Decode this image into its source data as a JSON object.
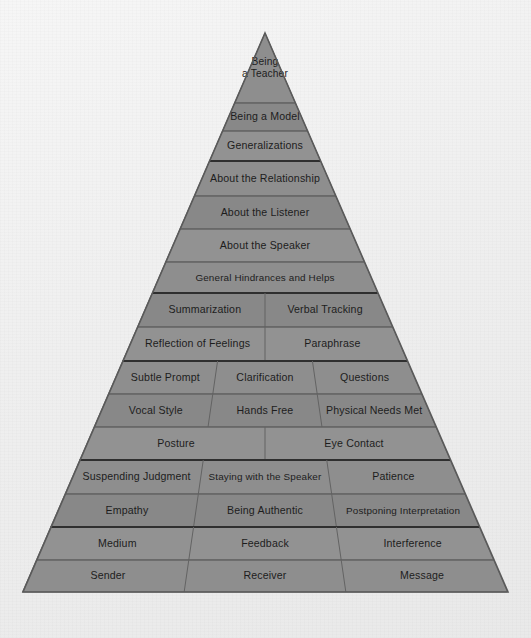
{
  "figure": {
    "name": "communication-pyramid",
    "shape": "triangle",
    "apex": {
      "x": 265,
      "y": 33
    },
    "base": {
      "left_x": 23,
      "right_x": 508,
      "y": 592
    },
    "colors": {
      "background": "#f1f1f1",
      "band_fill": "#8b8b8b",
      "band_border": "#5e5e5e",
      "outline": "#5a5a5a",
      "label_text": "#1d1d1d"
    }
  },
  "rows": [
    {
      "index": 0,
      "top": 33,
      "bottom": 103,
      "group_divider": false,
      "cells": [
        {
          "label": "Being\na Teacher",
          "lines": [
            "Being",
            "a Teacher"
          ]
        }
      ]
    },
    {
      "index": 1,
      "top": 103,
      "bottom": 131,
      "group_divider": false,
      "cells": [
        {
          "label": "Being a Model",
          "lines": [
            "Being a Model"
          ]
        }
      ]
    },
    {
      "index": 2,
      "top": 131,
      "bottom": 161,
      "group_divider": false,
      "cells": [
        {
          "label": "Generalizations",
          "lines": [
            "Generalizations"
          ]
        }
      ]
    },
    {
      "index": 3,
      "top": 161,
      "bottom": 196,
      "group_divider": true,
      "cells": [
        {
          "label": "About the Relationship",
          "lines": [
            "About the Relationship"
          ]
        }
      ]
    },
    {
      "index": 4,
      "top": 196,
      "bottom": 229,
      "group_divider": false,
      "cells": [
        {
          "label": "About the Listener",
          "lines": [
            "About the Listener"
          ]
        }
      ]
    },
    {
      "index": 5,
      "top": 229,
      "bottom": 262,
      "group_divider": false,
      "cells": [
        {
          "label": "About the Speaker",
          "lines": [
            "About the Speaker"
          ]
        }
      ]
    },
    {
      "index": 6,
      "top": 262,
      "bottom": 293,
      "group_divider": false,
      "cells": [
        {
          "label": "General Hindrances and Helps",
          "lines": [
            "General Hindrances and Helps"
          ]
        }
      ]
    },
    {
      "index": 7,
      "top": 293,
      "bottom": 327,
      "group_divider": true,
      "cells": [
        {
          "label": "Summarization",
          "lines": [
            "Summarization"
          ]
        },
        {
          "label": "Verbal Tracking",
          "lines": [
            "Verbal Tracking"
          ]
        }
      ]
    },
    {
      "index": 8,
      "top": 327,
      "bottom": 361,
      "group_divider": false,
      "cells": [
        {
          "label": "Reflection of Feelings",
          "lines": [
            "Reflection of Feelings"
          ]
        },
        {
          "label": "Paraphrase",
          "lines": [
            "Paraphrase"
          ]
        }
      ]
    },
    {
      "index": 9,
      "top": 361,
      "bottom": 394,
      "group_divider": true,
      "cells": [
        {
          "label": "Subtle Prompt",
          "lines": [
            "Subtle Prompt"
          ]
        },
        {
          "label": "Clarification",
          "lines": [
            "Clarification"
          ]
        },
        {
          "label": "Questions",
          "lines": [
            "Questions"
          ]
        }
      ]
    },
    {
      "index": 10,
      "top": 394,
      "bottom": 427,
      "group_divider": false,
      "cells": [
        {
          "label": "Vocal Style",
          "lines": [
            "Vocal Style"
          ]
        },
        {
          "label": "Hands Free",
          "lines": [
            "Hands Free"
          ]
        },
        {
          "label": "Physical Needs Met",
          "lines": [
            "Physical Needs Met"
          ]
        }
      ]
    },
    {
      "index": 11,
      "top": 427,
      "bottom": 460,
      "group_divider": false,
      "cells": [
        {
          "label": "Posture",
          "lines": [
            "Posture"
          ]
        },
        {
          "label": "Eye Contact",
          "lines": [
            "Eye Contact"
          ]
        }
      ]
    },
    {
      "index": 12,
      "top": 460,
      "bottom": 494,
      "group_divider": true,
      "cells": [
        {
          "label": "Suspending Judgment",
          "lines": [
            "Suspending Judgment"
          ]
        },
        {
          "label": "Staying with the Speaker",
          "lines": [
            "Staying with the Speaker"
          ]
        },
        {
          "label": "Patience",
          "lines": [
            "Patience"
          ]
        }
      ]
    },
    {
      "index": 13,
      "top": 494,
      "bottom": 527,
      "group_divider": false,
      "cells": [
        {
          "label": "Empathy",
          "lines": [
            "Empathy"
          ]
        },
        {
          "label": "Being Authentic",
          "lines": [
            "Being Authentic"
          ]
        },
        {
          "label": "Postponing Interpretation",
          "lines": [
            "Postponing Interpretation"
          ]
        }
      ]
    },
    {
      "index": 14,
      "top": 527,
      "bottom": 560,
      "group_divider": true,
      "cells": [
        {
          "label": "Medium",
          "lines": [
            "Medium"
          ]
        },
        {
          "label": "Feedback",
          "lines": [
            "Feedback"
          ]
        },
        {
          "label": "Interference",
          "lines": [
            "Interference"
          ]
        }
      ]
    },
    {
      "index": 15,
      "top": 560,
      "bottom": 592,
      "group_divider": false,
      "cells": [
        {
          "label": "Sender",
          "lines": [
            "Sender"
          ]
        },
        {
          "label": "Receiver",
          "lines": [
            "Receiver"
          ]
        },
        {
          "label": "Message",
          "lines": [
            "Message"
          ]
        }
      ]
    }
  ]
}
